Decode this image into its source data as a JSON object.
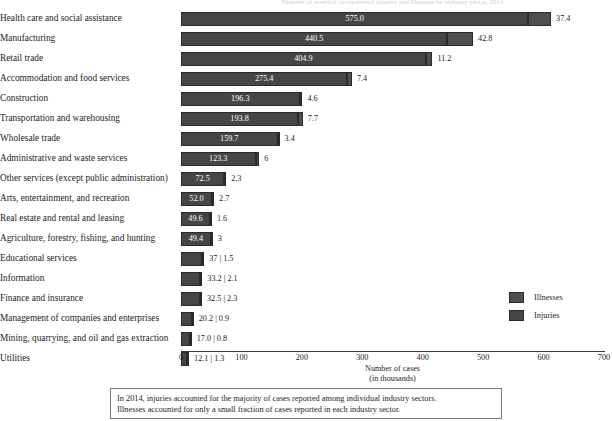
{
  "chart_data": {
    "type": "bar",
    "orientation": "horizontal",
    "stacked": true,
    "title": "Number of nonfatal occupational injuries and illnesses by industry sector, 2014",
    "xlabel": "Number of cases",
    "xlabel_sub": "(in thousands)",
    "ylabel": "",
    "xlim": [
      0,
      700
    ],
    "xticks": [
      0,
      100,
      200,
      300,
      400,
      500,
      600,
      700
    ],
    "grid": false,
    "legend_position": "right",
    "categories": [
      "Health care and social assistance",
      "Manufacturing",
      "Retail trade",
      "Accommodation and food services",
      "Construction",
      "Transportation and warehousing",
      "Wholesale trade",
      "Administrative and waste services",
      "Other services (except public administration)",
      "Arts, entertainment, and recreation",
      "Real estate and rental and leasing",
      "Agriculture, forestry, fishing, and hunting",
      "Educational services",
      "Information",
      "Finance and insurance",
      "Management of companies and enterprises",
      "Mining, quarrying, and oil and gas extraction",
      "Utilities"
    ],
    "series": [
      {
        "name": "Injuries",
        "values": [
          575.0,
          440.5,
          404.9,
          275.4,
          196.3,
          193.8,
          159.7,
          123.3,
          72.5,
          52.0,
          49.6,
          49.4,
          37,
          33.2,
          32.5,
          20.2,
          17.0,
          12.1
        ]
      },
      {
        "name": "Illnesses",
        "values": [
          37.4,
          42.8,
          11.2,
          7.4,
          4.6,
          7.7,
          3.4,
          6,
          2.3,
          2.7,
          1.6,
          3,
          1.5,
          2.1,
          2.3,
          0.9,
          0.8,
          1.3
        ]
      }
    ],
    "rows": [
      {
        "category": "Health care and social assistance",
        "injuries": 575.0,
        "illnesses": 37.4,
        "injuries_label": "575.0",
        "illnesses_label": "37.4",
        "labels_inside": true,
        "combined_label": "575.0 | 37.4"
      },
      {
        "category": "Manufacturing",
        "injuries": 440.5,
        "illnesses": 42.8,
        "injuries_label": "440.5",
        "illnesses_label": "42.8",
        "labels_inside": true,
        "combined_label": "440.5 | 42.8"
      },
      {
        "category": "Retail trade",
        "injuries": 404.9,
        "illnesses": 11.2,
        "injuries_label": "404.9",
        "illnesses_label": "11.2",
        "labels_inside": true,
        "combined_label": "404.9 | 11.2"
      },
      {
        "category": "Accommodation and food services",
        "injuries": 275.4,
        "illnesses": 7.4,
        "injuries_label": "275.4",
        "illnesses_label": "7.4",
        "labels_inside": true,
        "combined_label": "275.4 | 7.4"
      },
      {
        "category": "Construction",
        "injuries": 196.3,
        "illnesses": 4.6,
        "injuries_label": "196.3",
        "illnesses_label": "4.6",
        "labels_inside": true,
        "combined_label": "196.3 | 4.6"
      },
      {
        "category": "Transportation and warehousing",
        "injuries": 193.8,
        "illnesses": 7.7,
        "injuries_label": "193.8",
        "illnesses_label": "7.7",
        "labels_inside": true,
        "combined_label": "193.8 | 7.7"
      },
      {
        "category": "Wholesale trade",
        "injuries": 159.7,
        "illnesses": 3.4,
        "injuries_label": "159.7",
        "illnesses_label": "3.4",
        "labels_inside": true,
        "combined_label": "159.7 | 3.4"
      },
      {
        "category": "Administrative and waste services",
        "injuries": 123.3,
        "illnesses": 6,
        "injuries_label": "123.3",
        "illnesses_label": "6",
        "labels_inside": true,
        "combined_label": "123.3 | 6"
      },
      {
        "category": "Other services (except public administration)",
        "injuries": 72.5,
        "illnesses": 2.3,
        "injuries_label": "72.5",
        "illnesses_label": "2.3",
        "labels_inside": true,
        "combined_label": "72.5 | 2.3"
      },
      {
        "category": "Arts, entertainment, and recreation",
        "injuries": 52.0,
        "illnesses": 2.7,
        "injuries_label": "52.0",
        "illnesses_label": "2.7",
        "labels_inside": true,
        "combined_label": "52.0 | 2.7"
      },
      {
        "category": "Real estate and rental and leasing",
        "injuries": 49.6,
        "illnesses": 1.6,
        "injuries_label": "49.6",
        "illnesses_label": "1.6",
        "labels_inside": true,
        "combined_label": "49.6 | 1.6"
      },
      {
        "category": "Agriculture, forestry, fishing, and hunting",
        "injuries": 49.4,
        "illnesses": 3,
        "injuries_label": "49.4",
        "illnesses_label": "3",
        "labels_inside": true,
        "combined_label": "49.4 | 3"
      },
      {
        "category": "Educational services",
        "injuries": 37,
        "illnesses": 1.5,
        "injuries_label": "37",
        "illnesses_label": "1.5",
        "labels_inside": false,
        "combined_label": "37 | 1.5"
      },
      {
        "category": "Information",
        "injuries": 33.2,
        "illnesses": 2.1,
        "injuries_label": "33.2",
        "illnesses_label": "2.1",
        "labels_inside": false,
        "combined_label": "33.2 | 2.1"
      },
      {
        "category": "Finance and insurance",
        "injuries": 32.5,
        "illnesses": 2.3,
        "injuries_label": "32.5",
        "illnesses_label": "2.3",
        "labels_inside": false,
        "combined_label": "32.5 | 2.3"
      },
      {
        "category": "Management of companies and enterprises",
        "injuries": 20.2,
        "illnesses": 0.9,
        "injuries_label": "20.2",
        "illnesses_label": "0.9",
        "labels_inside": false,
        "combined_label": "20.2 | 0.9"
      },
      {
        "category": "Mining, quarrying, and oil and gas extraction",
        "injuries": 17.0,
        "illnesses": 0.8,
        "injuries_label": "17.0",
        "illnesses_label": "0.8",
        "labels_inside": false,
        "combined_label": "17.0 | 0.8"
      },
      {
        "category": "Utilities",
        "injuries": 12.1,
        "illnesses": 1.3,
        "injuries_label": "12.1",
        "illnesses_label": "1.3",
        "labels_inside": false,
        "combined_label": "12.1 | 1.3"
      }
    ],
    "legend": [
      {
        "label": "Illnesses",
        "color": "#4e4e4e"
      },
      {
        "label": "Injuries",
        "color": "#464646"
      }
    ],
    "colors": {
      "illnesses": "#4e4e4e",
      "injuries": "#464646",
      "text": "#1d1d1d",
      "axis": "#3a3a3a"
    }
  },
  "caption": {
    "line1": "In 2014, injuries accounted for the majority of cases reported among individual industry sectors.",
    "line2": "Illnesses accounted for only a small fraction of cases reported in each industry sector."
  }
}
